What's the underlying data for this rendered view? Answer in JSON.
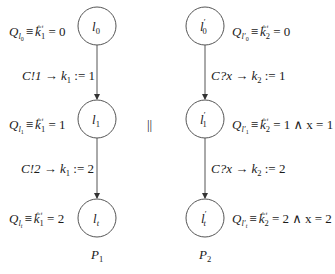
{
  "diagram": {
    "type": "parallel-automata",
    "separator": "||",
    "processes": [
      {
        "name": "P",
        "name_sub": "1",
        "nodes": [
          {
            "id": "l0",
            "label": "l",
            "label_sub": "0",
            "prime": "",
            "cx": 97,
            "cy": 26,
            "pred": {
              "Q": "Q",
              "Qsub": "l",
              "Qsubsub": "0",
              "def": "def",
              "body": "k",
              "body_sub": "1",
              "rest": " = 0"
            }
          },
          {
            "id": "l1",
            "label": "l",
            "label_sub": "1",
            "prime": "",
            "cx": 97,
            "cy": 119,
            "pred": {
              "Q": "Q",
              "Qsub": "l",
              "Qsubsub": "1",
              "def": "def",
              "body": "k",
              "body_sub": "1",
              "rest": " = 1"
            }
          },
          {
            "id": "lt",
            "label": "l",
            "label_sub": "t",
            "prime": "",
            "cx": 97,
            "cy": 218,
            "pred": {
              "Q": "Q",
              "Qsub": "l",
              "Qsubsub": "t",
              "def": "def",
              "body": "k",
              "body_sub": "1",
              "rest": " = 2"
            }
          }
        ],
        "edges": [
          {
            "from": "l0",
            "to": "l1",
            "label_a": "C!1 → ",
            "var": "k",
            "var_sub": "1",
            "label_b": " := 1"
          },
          {
            "from": "l1",
            "to": "lt",
            "label_a": "C!2 → ",
            "var": "k",
            "var_sub": "1",
            "label_b": " := 2"
          }
        ]
      },
      {
        "name": "P",
        "name_sub": "2",
        "nodes": [
          {
            "id": "l0p",
            "label": "l",
            "label_sub": "0",
            "prime": "′",
            "cx": 205,
            "cy": 26,
            "pred": {
              "Q": "Q",
              "Qsub": "l′",
              "Qsubsub": "0",
              "def": "def",
              "body": "k",
              "body_sub": "2",
              "rest": " = 0"
            }
          },
          {
            "id": "l1p",
            "label": "l",
            "label_sub": "1",
            "prime": "′",
            "cx": 205,
            "cy": 119,
            "pred": {
              "Q": "Q",
              "Qsub": "l′",
              "Qsubsub": "1",
              "def": "def",
              "body": "k",
              "body_sub": "2",
              "rest": " = 1 ∧ x = 1"
            }
          },
          {
            "id": "ltp",
            "label": "l",
            "label_sub": "t",
            "prime": "′",
            "cx": 205,
            "cy": 218,
            "pred": {
              "Q": "Q",
              "Qsub": "l′",
              "Qsubsub": "t",
              "def": "def",
              "body": "k",
              "body_sub": "2",
              "rest": " = 2 ∧ x = 2"
            }
          }
        ],
        "edges": [
          {
            "from": "l0p",
            "to": "l1p",
            "label_a": "C?x → ",
            "var": "k",
            "var_sub": "2",
            "label_b": " := 1"
          },
          {
            "from": "l1p",
            "to": "ltp",
            "label_a": "C?x → ",
            "var": "k",
            "var_sub": "2",
            "label_b": " := 2"
          }
        ]
      }
    ]
  }
}
